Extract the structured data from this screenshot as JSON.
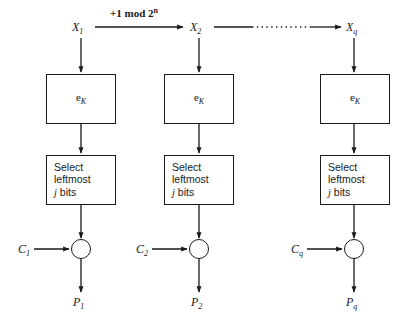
{
  "diagram": {
    "counter_increment_label": "+1 mod 2",
    "counter_increment_exponent": "n",
    "columns": [
      {
        "id": "col-1",
        "counter_label": "X",
        "counter_sub": "1",
        "cipher_box_label": "e",
        "cipher_box_sub": "K",
        "select_line_1": "Select",
        "select_line_2": "leftmost",
        "select_line_3_italic": "j",
        "select_line_3_rest": " bits",
        "ciphertext_label": "C",
        "ciphertext_sub": "1",
        "plaintext_label": "P",
        "plaintext_sub": "1",
        "xor_symbol": "xor"
      },
      {
        "id": "col-2",
        "counter_label": "X",
        "counter_sub": "2",
        "cipher_box_label": "e",
        "cipher_box_sub": "K",
        "select_line_1": "Select",
        "select_line_2": "leftmost",
        "select_line_3_italic": "j",
        "select_line_3_rest": " bits",
        "ciphertext_label": "C",
        "ciphertext_sub": "2",
        "plaintext_label": "P",
        "plaintext_sub": "2",
        "xor_symbol": "xor"
      },
      {
        "id": "col-q",
        "counter_label": "X",
        "counter_sub": "q",
        "cipher_box_label": "e",
        "cipher_box_sub": "K",
        "select_line_1": "Select",
        "select_line_2": "leftmost",
        "select_line_3_italic": "j",
        "select_line_3_rest": " bits",
        "ciphertext_label": "C",
        "ciphertext_sub": "q",
        "plaintext_label": "P",
        "plaintext_sub": "q",
        "xor_symbol": "xor"
      }
    ],
    "colors": {
      "stroke": "#1a1a1a",
      "background": "#ffffff"
    }
  }
}
